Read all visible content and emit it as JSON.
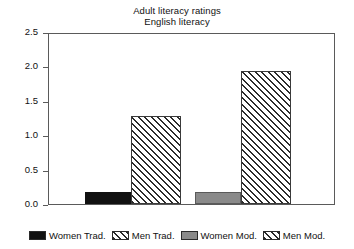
{
  "chart_data": {
    "type": "bar",
    "title": "Adult literacy ratings",
    "subtitle": "English literacy",
    "xlabel": "",
    "ylabel": "",
    "ylim": [
      0.0,
      2.5
    ],
    "yticks": [
      "0.0",
      "0.5",
      "1.0",
      "1.5",
      "2.0",
      "2.5"
    ],
    "ytick_values": [
      0.0,
      0.5,
      1.0,
      1.5,
      2.0,
      2.5
    ],
    "grid": false,
    "legend_position": "bottom",
    "categories": [
      "Women Trad.",
      "Men Trad.",
      "Women Mod.",
      "Men Mod."
    ],
    "values": [
      0.17,
      1.3,
      0.17,
      1.95
    ],
    "series": [
      {
        "name": "Women Trad.",
        "value": 0.17,
        "fill": "solid-black",
        "color": "#111111"
      },
      {
        "name": "Men Trad.",
        "value": 1.3,
        "fill": "hatch",
        "color": "#ffffff"
      },
      {
        "name": "Women Mod.",
        "value": 0.17,
        "fill": "solid-gray",
        "color": "#8a8a8a"
      },
      {
        "name": "Men Mod.",
        "value": 1.95,
        "fill": "hatch",
        "color": "#ffffff"
      }
    ]
  },
  "legend": {
    "items": [
      {
        "label": "Women Trad.",
        "fill": "solid-black"
      },
      {
        "label": "Men Trad.",
        "fill": "hatch"
      },
      {
        "label": "Women Mod.",
        "fill": "solid-gray"
      },
      {
        "label": "Men Mod.",
        "fill": "hatch"
      }
    ]
  },
  "axes": {
    "frame_color": "#5a5a5a",
    "text_color": "#111111"
  }
}
